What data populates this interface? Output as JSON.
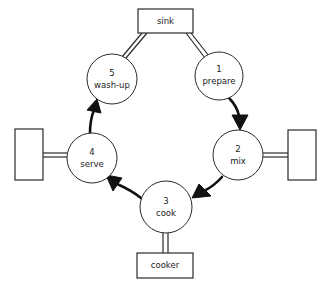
{
  "diagram": {
    "type": "cyclic process flow",
    "nodes": [
      {
        "number": "1",
        "label": "prepare"
      },
      {
        "number": "2",
        "label": "mix"
      },
      {
        "number": "3",
        "label": "cook"
      },
      {
        "number": "4",
        "label": "serve"
      },
      {
        "number": "5",
        "label": "wash-up"
      }
    ],
    "stations": {
      "sink": {
        "label": "sink",
        "connects_to": [
          "5",
          "1"
        ]
      },
      "cooker": {
        "label": "cooker",
        "connects_to": [
          "3"
        ]
      },
      "left_station": {
        "label": "",
        "connects_to": [
          "4"
        ]
      },
      "right_station": {
        "label": "",
        "connects_to": [
          "2"
        ]
      }
    },
    "edges": [
      {
        "from": "1",
        "to": "2"
      },
      {
        "from": "2",
        "to": "3"
      },
      {
        "from": "3",
        "to": "4"
      },
      {
        "from": "4",
        "to": "5"
      }
    ],
    "colors": {
      "line": "#2a2a2a",
      "arrow": "#111111",
      "background": "#ffffff"
    }
  }
}
